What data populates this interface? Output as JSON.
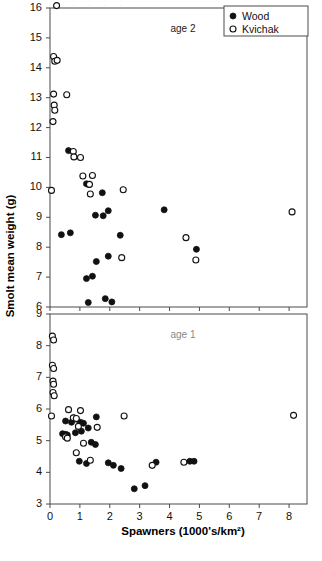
{
  "figure": {
    "cropped_caption_remnant": ". . . . . . . .",
    "y_axis_label": "Smolt mean weight (g)",
    "x_axis_label": "Spawners (1000's/km²)"
  },
  "legend": {
    "position": "top-right",
    "entries": [
      {
        "label": "Wood",
        "marker": "filled-circle",
        "color": "#111111"
      },
      {
        "label": "Kvichak",
        "marker": "open-circle",
        "color": "#ffffff"
      }
    ]
  },
  "chart_data": [
    {
      "type": "scatter",
      "panel": "upper",
      "title": "age 2",
      "xlabel": "Spawners (1000's/km²)",
      "ylabel": "Smolt mean weight (g)",
      "xlim": [
        0,
        8.6
      ],
      "ylim": [
        6,
        16
      ],
      "xticks": [
        0,
        1,
        2,
        3,
        4,
        5,
        6,
        7,
        8
      ],
      "yticks": [
        6,
        7,
        8,
        9,
        10,
        11,
        12,
        13,
        14,
        15,
        16
      ],
      "grid": false,
      "series": [
        {
          "name": "Wood",
          "marker": "filled-circle",
          "points": [
            [
              0.62,
              11.23
            ],
            [
              1.22,
              10.12
            ],
            [
              1.3,
              10.1
            ],
            [
              1.75,
              9.82
            ],
            [
              0.38,
              8.42
            ],
            [
              0.68,
              8.48
            ],
            [
              1.52,
              9.07
            ],
            [
              1.78,
              9.05
            ],
            [
              1.95,
              9.22
            ],
            [
              2.35,
              8.4
            ],
            [
              1.55,
              7.52
            ],
            [
              1.95,
              7.7
            ],
            [
              1.22,
              6.95
            ],
            [
              1.42,
              7.03
            ],
            [
              1.28,
              6.15
            ],
            [
              1.85,
              6.28
            ],
            [
              2.07,
              6.17
            ],
            [
              3.82,
              9.25
            ],
            [
              4.9,
              7.93
            ]
          ]
        },
        {
          "name": "Kvichak",
          "marker": "open-circle",
          "points": [
            [
              0.22,
              16.08
            ],
            [
              0.12,
              14.38
            ],
            [
              0.16,
              14.22
            ],
            [
              0.24,
              14.25
            ],
            [
              0.12,
              13.12
            ],
            [
              0.56,
              13.1
            ],
            [
              0.14,
              12.75
            ],
            [
              0.16,
              12.58
            ],
            [
              0.1,
              12.2
            ],
            [
              0.78,
              11.2
            ],
            [
              0.8,
              11.02
            ],
            [
              1.02,
              11.0
            ],
            [
              1.1,
              10.38
            ],
            [
              1.42,
              10.4
            ],
            [
              1.32,
              10.1
            ],
            [
              1.35,
              9.78
            ],
            [
              0.05,
              9.9
            ],
            [
              2.45,
              9.92
            ],
            [
              4.55,
              8.32
            ],
            [
              4.88,
              7.57
            ],
            [
              2.4,
              7.65
            ],
            [
              8.1,
              9.18
            ]
          ]
        }
      ]
    },
    {
      "type": "scatter",
      "panel": "lower",
      "title": "age 1",
      "xlabel": "Spawners (1000's/km²)",
      "ylabel": "Smolt mean weight (g)",
      "xlim": [
        0,
        8.6
      ],
      "ylim": [
        3,
        9
      ],
      "xticks": [
        0,
        1,
        2,
        3,
        4,
        5,
        6,
        7,
        8
      ],
      "yticks": [
        3,
        4,
        5,
        6,
        7,
        8,
        9
      ],
      "grid": false,
      "series": [
        {
          "name": "Wood",
          "marker": "filled-circle",
          "points": [
            [
              0.52,
              5.62
            ],
            [
              0.72,
              5.58
            ],
            [
              0.8,
              5.72
            ],
            [
              0.88,
              5.68
            ],
            [
              1.02,
              5.58
            ],
            [
              1.12,
              5.55
            ],
            [
              0.42,
              5.22
            ],
            [
              0.52,
              5.2
            ],
            [
              0.58,
              5.18
            ],
            [
              0.85,
              5.25
            ],
            [
              1.05,
              5.3
            ],
            [
              1.28,
              5.4
            ],
            [
              1.55,
              5.75
            ],
            [
              1.38,
              4.95
            ],
            [
              1.52,
              4.88
            ],
            [
              0.98,
              4.35
            ],
            [
              1.22,
              4.28
            ],
            [
              1.95,
              4.3
            ],
            [
              2.12,
              4.22
            ],
            [
              2.38,
              4.12
            ],
            [
              2.82,
              3.48
            ],
            [
              3.18,
              3.58
            ],
            [
              3.55,
              4.32
            ],
            [
              4.68,
              4.35
            ],
            [
              4.82,
              4.35
            ]
          ]
        },
        {
          "name": "Kvichak",
          "marker": "open-circle",
          "points": [
            [
              0.08,
              8.3
            ],
            [
              0.12,
              8.18
            ],
            [
              0.08,
              7.38
            ],
            [
              0.12,
              7.28
            ],
            [
              0.1,
              6.88
            ],
            [
              0.12,
              6.78
            ],
            [
              0.1,
              6.52
            ],
            [
              0.14,
              6.42
            ],
            [
              0.05,
              5.78
            ],
            [
              0.62,
              5.98
            ],
            [
              1.02,
              5.95
            ],
            [
              0.78,
              5.72
            ],
            [
              0.88,
              5.7
            ],
            [
              0.95,
              5.45
            ],
            [
              0.52,
              5.12
            ],
            [
              0.58,
              5.08
            ],
            [
              1.12,
              4.92
            ],
            [
              0.88,
              4.62
            ],
            [
              2.48,
              5.78
            ],
            [
              8.15,
              5.8
            ],
            [
              1.58,
              5.42
            ],
            [
              3.42,
              4.22
            ],
            [
              4.48,
              4.32
            ],
            [
              1.35,
              4.38
            ]
          ]
        }
      ]
    }
  ]
}
